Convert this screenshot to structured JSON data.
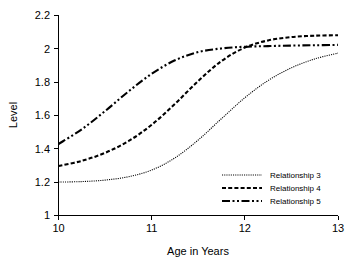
{
  "chart_data": {
    "type": "line",
    "title": "",
    "xlabel": "Age in Years",
    "ylabel": "Level",
    "xlim": [
      10,
      13
    ],
    "ylim": [
      1,
      2.2
    ],
    "grid": false,
    "legend_position": "lower-right",
    "xticks": [
      "10",
      "11",
      "12",
      "13"
    ],
    "xtick_values": [
      10,
      11,
      12,
      13
    ],
    "yticks": [
      "1",
      "1.2",
      "1.4",
      "1.6",
      "1.8",
      "2",
      "2.2"
    ],
    "ytick_values": [
      1,
      1.2,
      1.4,
      1.6,
      1.8,
      2,
      2.2
    ],
    "x": [
      10,
      10.25,
      10.5,
      10.75,
      11,
      11.25,
      11.5,
      11.75,
      12,
      12.25,
      12.5,
      12.75,
      13
    ],
    "series": [
      {
        "name": "Relationship 3",
        "style": "dotted",
        "values": [
          1.2,
          1.203,
          1.212,
          1.232,
          1.272,
          1.345,
          1.452,
          1.58,
          1.705,
          1.808,
          1.884,
          1.937,
          1.972
        ]
      },
      {
        "name": "Relationship 4",
        "style": "dashed",
        "values": [
          1.296,
          1.327,
          1.375,
          1.445,
          1.543,
          1.668,
          1.805,
          1.925,
          2.005,
          2.048,
          2.068,
          2.076,
          2.079
        ]
      },
      {
        "name": "Relationship 5",
        "style": "dash-dot-dot",
        "values": [
          1.428,
          1.516,
          1.625,
          1.742,
          1.848,
          1.929,
          1.978,
          2.0,
          2.01,
          2.014,
          2.017,
          2.019,
          2.021
        ]
      }
    ],
    "colors": {
      "series": "#000000",
      "axis": "#000000",
      "background": "#ffffff"
    }
  },
  "legend": {
    "items": [
      {
        "label": "Relationship 3"
      },
      {
        "label": "Relationship 4"
      },
      {
        "label": "Relationship 5"
      }
    ]
  }
}
